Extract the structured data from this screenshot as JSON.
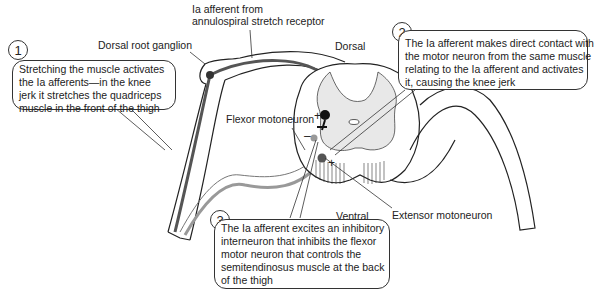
{
  "labels": {
    "ia_afferent": [
      "Ia afferent from",
      "annulospiral stretch receptor"
    ],
    "dorsal_root_ganglion": "Dorsal root ganglion",
    "dorsal": "Dorsal",
    "ventral": "Ventral",
    "flexor_motoneuron": "Flexor motoneuron",
    "extensor_motoneuron": "Extensor motoneuron",
    "plus_flexor": "+",
    "minus": "–",
    "plus_extensor": "+"
  },
  "callouts": [
    {
      "number": "1",
      "lines": [
        "Stretching the muscle activates",
        "the Ia afferents—in the knee",
        "jerk it stretches the quadriceps",
        "muscle in the front of the thigh"
      ]
    },
    {
      "number": "2",
      "lines": [
        "The Ia afferent makes direct contact with",
        "the motor neuron from the same muscle",
        "relating to the Ia afferent and activates",
        "it, causing the knee jerk"
      ]
    },
    {
      "number": "3",
      "lines": [
        "The Ia afferent excites an inhibitory",
        "interneuron that inhibits the flexor",
        "motor neuron that controls the",
        "semitendinosus muscle at the back",
        "of the thigh"
      ]
    }
  ]
}
